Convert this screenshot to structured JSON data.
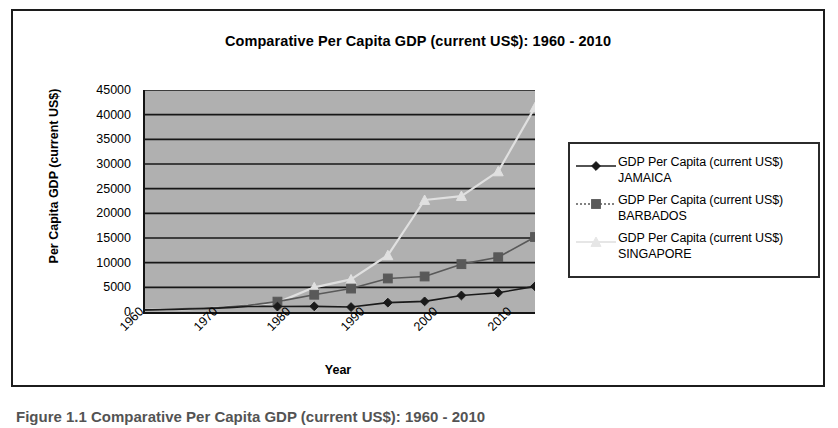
{
  "chart_data": {
    "type": "line",
    "title": "Comparative Per Capita GDP (current US$): 1960 - 2010",
    "xlabel": "Year",
    "ylabel": "Per Capita GDP (current US$)",
    "ylim": [
      0,
      45000
    ],
    "xlim": [
      1960,
      2013
    ],
    "grid": true,
    "legend_position": "right",
    "plot_background": "#b0b0b0",
    "y_ticks": [
      "45000",
      "40000",
      "35000",
      "30000",
      "25000",
      "20000",
      "15000",
      "10000",
      "5000",
      "0"
    ],
    "y_tick_values": [
      45000,
      40000,
      35000,
      30000,
      25000,
      20000,
      15000,
      10000,
      5000,
      0
    ],
    "x_ticks": [
      "1960",
      "1970",
      "1980",
      "1990",
      "2000",
      "2010"
    ],
    "x_tick_values": [
      1960,
      1970,
      1980,
      1990,
      2000,
      2010
    ],
    "series": [
      {
        "name": "GDP Per Capita (current US$) JAMAICA",
        "color": "#1a1a1a",
        "marker": "diamond",
        "x": [
          1960,
          1962,
          1964,
          1966,
          1968,
          1970,
          1972,
          1974,
          1976,
          1978,
          1983,
          1988,
          1993,
          1998,
          2003,
          2008,
          2013
        ],
        "y": [
          430,
          470,
          520,
          600,
          660,
          780,
          930,
          1100,
          1150,
          1100,
          1150,
          1000,
          1900,
          2150,
          3350,
          3900,
          5200
        ]
      },
      {
        "name": "GDP Per Capita (current US$) BARBADOS",
        "color": "#595959",
        "marker": "square",
        "x": [
          1960,
          1966,
          1970,
          1974,
          1978,
          1983,
          1988,
          1993,
          1998,
          2003,
          2008,
          2013
        ],
        "y": [
          400,
          700,
          900,
          1350,
          2100,
          3500,
          4750,
          6800,
          7200,
          9700,
          11100,
          15200
        ]
      },
      {
        "name": "GDP Per Capita (current US$) SINGAPORE",
        "color": "#e0e0e0",
        "marker": "triangle",
        "x": [
          1960,
          1966,
          1970,
          1974,
          1978,
          1983,
          1988,
          1993,
          1998,
          2003,
          2008,
          2013
        ],
        "y": [
          430,
          600,
          900,
          1350,
          1900,
          5000,
          6600,
          11500,
          22700,
          23500,
          28500,
          41500
        ]
      }
    ]
  },
  "legend": {
    "items": [
      {
        "label": "GDP Per Capita (current US$) JAMAICA",
        "marker": "diamond-marker",
        "color": "#1a1a1a"
      },
      {
        "label": "GDP Per Capita (current US$) BARBADOS",
        "marker": "square-marker",
        "color": "#595959"
      },
      {
        "label": "GDP Per Capita (current US$) SINGAPORE",
        "marker": "triangle-marker",
        "color": "#e6e6e6"
      }
    ]
  },
  "caption": {
    "text": "Figure 1.1 Comparative Per Capita GDP (current US$): 1960 - 2010"
  }
}
